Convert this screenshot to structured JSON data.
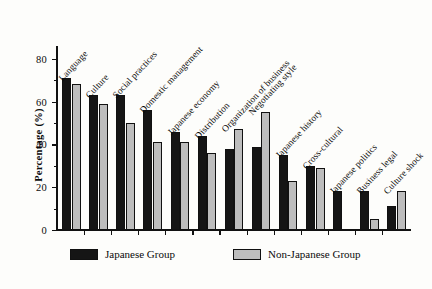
{
  "chart_data": {
    "type": "bar",
    "title": "",
    "xlabel": "",
    "ylabel": "Percentage (%)",
    "ylim": [
      0,
      85
    ],
    "yticks": [
      0,
      20,
      40,
      60,
      80
    ],
    "ytick_labels": [
      "0",
      "20",
      "40",
      "60",
      "80"
    ],
    "minor_ticks": true,
    "grid": false,
    "legend_position": "bottom",
    "categories": [
      "Language",
      "Culture",
      "Social practices",
      "Domestic management",
      "Japanese economy",
      "Distribution",
      "Organization of business",
      "Negotiating style",
      "Japanese history",
      "Cross-cultural",
      "Japanese politics",
      "Business legal",
      "Culture shock"
    ],
    "series": [
      {
        "name": "Japanese Group",
        "color": "#151515",
        "values": [
          71,
          63,
          63,
          56,
          46,
          44,
          38,
          39,
          35,
          30,
          18,
          18,
          11
        ]
      },
      {
        "name": "Non-Japanese Group",
        "color": "#bdbdbd",
        "values": [
          68,
          59,
          50,
          41,
          41,
          36,
          47,
          55,
          23,
          29,
          0,
          5,
          18
        ]
      }
    ]
  },
  "legend": {
    "items": [
      {
        "label": "Japanese Group",
        "swatch": "black"
      },
      {
        "label": "Non-Japanese Group",
        "swatch": "gray"
      }
    ]
  },
  "axis": {
    "y_title": "Percentage (%)"
  }
}
